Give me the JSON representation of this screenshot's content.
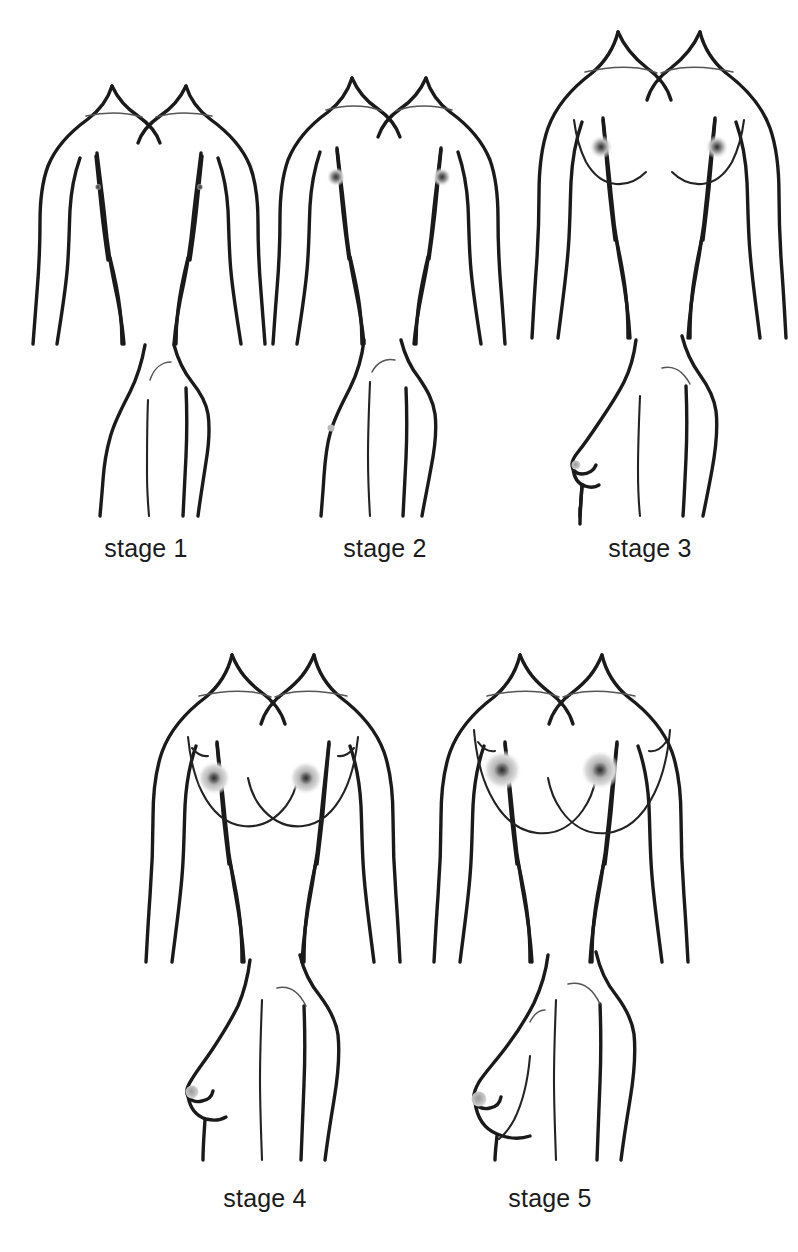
{
  "diagram": {
    "background_color": "#ffffff",
    "line_color": "#1a1a1a",
    "detail_line_color": "#555555",
    "areola_color": "#9a9a9a",
    "nipple_color": "#3a3a3a",
    "rows": [
      {
        "name": "top-row",
        "stages": [
          "stage 1",
          "stage 2",
          "stage 3"
        ]
      },
      {
        "name": "bottom-row",
        "stages": [
          "stage 4",
          "stage 5"
        ]
      }
    ],
    "labels": {
      "stage1": "stage 1",
      "stage2": "stage 2",
      "stage3": "stage 3",
      "stage4": "stage 4",
      "stage5": "stage 5"
    },
    "stages": [
      {
        "id": "stage-1",
        "label": "stage 1",
        "front_view": "flat prepubertal chest, torso outline with arms at sides, small collarbone lines, tiny nipple dots only",
        "side_view": "flat chest profile, no breast projection",
        "areola_size": "tiny",
        "breast_contour": "none",
        "label_x": 146,
        "label_y": 557
      },
      {
        "id": "stage-2",
        "label": "stage 2",
        "front_view": "breast bud, slight elevation, small grey areola halo",
        "side_view": "very slight elevation of breast and papilla",
        "areola_size": "small",
        "breast_contour": "bud",
        "label_x": 385,
        "label_y": 557
      },
      {
        "id": "stage-3",
        "label": "stage 3",
        "front_view": "enlargement of breast and areola, underbust curve visible",
        "side_view": "breast mound projects, continuous contour",
        "areola_size": "medium",
        "breast_contour": "mound",
        "label_x": 650,
        "label_y": 557
      },
      {
        "id": "stage-4",
        "label": "stage 4",
        "front_view": "areola and papilla form secondary mound above the breast contour",
        "side_view": "secondary mound of areola projecting at nipple",
        "areola_size": "large",
        "breast_contour": "secondary mound",
        "label_x": 265,
        "label_y": 1207
      },
      {
        "id": "stage-5",
        "label": "stage 5",
        "front_view": "mature adult breast, areola recessed to general breast contour",
        "side_view": "mature breast, smooth rounded contour",
        "areola_size": "large",
        "breast_contour": "mature",
        "label_x": 550,
        "label_y": 1207
      }
    ]
  }
}
